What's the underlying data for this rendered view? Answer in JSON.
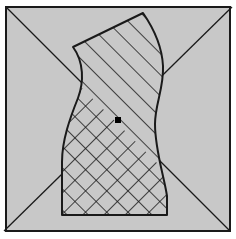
{
  "figure": {
    "title": "",
    "caption": "",
    "canvas": {
      "width": 236,
      "height": 239,
      "background_color": "#ffffff"
    },
    "frame": {
      "label": "outer square frame",
      "x": 5,
      "y": 6,
      "width": 226,
      "height": 226,
      "fill_color": "#c8c8c8",
      "stroke_color": "#1a1a1a",
      "stroke_width": 2
    },
    "diagonals": {
      "label": "corner-to-corner diagonals",
      "stroke_color": "#1a1a1a",
      "stroke_width": 1.3,
      "lines": [
        {
          "name": "diagonal-tl-br",
          "x1": 5,
          "y1": 6,
          "x2": 231,
          "y2": 232
        },
        {
          "name": "diagonal-tr-bl",
          "x1": 231,
          "y1": 6,
          "x2": 5,
          "y2": 232
        }
      ]
    },
    "region": {
      "label": "hatched wavy column region",
      "fill_color": "#c8c8c8",
      "stroke_color": "#1a1a1a",
      "stroke_width": 2,
      "outline_path": "M 73 47 L 143 13 C 152 26 162 46 163 66 C 164 88 155 104 155 124 C 155 150 164 176 167 196 L 167 215 L 62 215 L 62 162 C 62 140 70 118 78 98 C 84 82 84 62 73 47 Z",
      "boundary_points": [
        {
          "name": "apex-left",
          "x": 73,
          "y": 47
        },
        {
          "name": "apex-top-right",
          "x": 143,
          "y": 13
        },
        {
          "name": "right-bulge",
          "x": 163,
          "y": 66
        },
        {
          "name": "right-waist",
          "x": 155,
          "y": 124
        },
        {
          "name": "bottom-right-corner",
          "x": 167,
          "y": 215
        },
        {
          "name": "bottom-left-corner",
          "x": 62,
          "y": 215
        },
        {
          "name": "left-waist",
          "x": 62,
          "y": 162
        },
        {
          "name": "left-bulge",
          "x": 82,
          "y": 86
        }
      ]
    },
    "hatching": {
      "label": "diagonal line hatching",
      "stroke_color": "#1a1a1a",
      "stroke_width": 1.6,
      "spacing_px": 15,
      "primary_direction": "rising-45",
      "secondary_direction": "falling-45",
      "secondary_coverage": "lower-left portion only",
      "divider_line": {
        "x1": 58,
        "y1": 64,
        "x2": 178,
        "y2": 184
      }
    },
    "marker": {
      "label": "center point marker",
      "shape": "square",
      "x": 118,
      "y": 120,
      "size": 6,
      "fill_color": "#000000"
    }
  }
}
